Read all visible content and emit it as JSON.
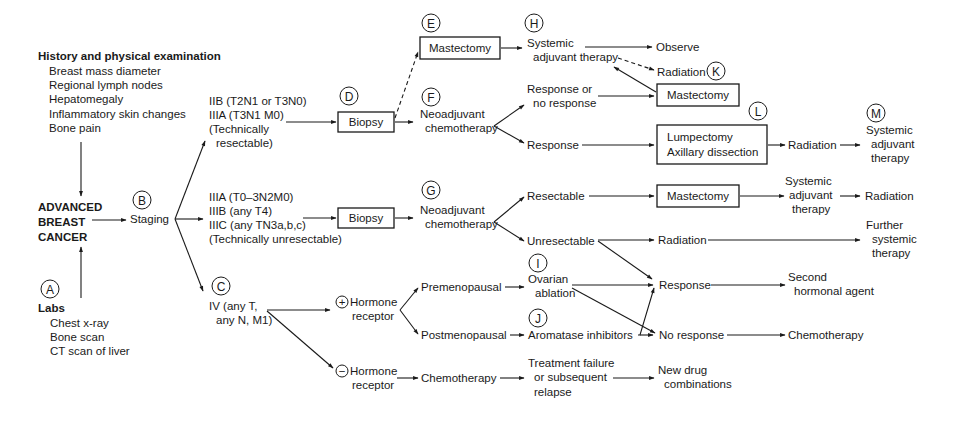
{
  "diagram": {
    "nodes": {
      "history_title": "History and physical examination",
      "history_items": [
        "Breast mass diameter",
        "Regional lymph nodes",
        "Hepatomegaly",
        "Inflammatory skin changes",
        "Bone pain"
      ],
      "abc": [
        "ADVANCED",
        "BREAST",
        "CANCER"
      ],
      "labs_title": "Labs",
      "labs_items": [
        "Chest x-ray",
        "Bone scan",
        "CT scan of liver"
      ],
      "staging": "Staging",
      "stage_resectable": [
        "IIB (T2N1 or T3N0)",
        "IIIA (T3N1 M0)",
        "(Technically",
        "resectable)"
      ],
      "stage_unresectable": [
        "IIIA (T0–3N2M0)",
        "IIIB (any T4)",
        "IIIC (any TN3a,b,c)",
        "(Technically unresectable)"
      ],
      "stage_iv": [
        "IV (any T,",
        "any N, M1)"
      ],
      "biopsy_1": "Biopsy",
      "biopsy_2": "Biopsy",
      "mastectomy_e": "Mastectomy",
      "neoadj_f": [
        "Neoadjuvant",
        "chemotherapy"
      ],
      "neoadj_g": [
        "Neoadjuvant",
        "chemotherapy"
      ],
      "systemic_h": [
        "Systemic",
        "adjuvant therapy"
      ],
      "observe": "Observe",
      "radiation_k": "Radiation",
      "resp_or_no": [
        "Response or",
        "no response"
      ],
      "mastectomy_k": "Mastectomy",
      "response_f": "Response",
      "lumpectomy": [
        "Lumpectomy",
        "Axillary dissection"
      ],
      "radiation_l": "Radiation",
      "systemic_m": [
        "Systemic",
        "adjuvant",
        "therapy"
      ],
      "resectable": "Resectable",
      "mastectomy_g": "Mastectomy",
      "systemic_g": [
        "Systemic",
        "adjuvant",
        "therapy"
      ],
      "radiation_g": "Radiation",
      "unresectable": "Unresectable",
      "radiation_u": "Radiation",
      "further": [
        "Further",
        "systemic",
        "therapy"
      ],
      "hr_pos": [
        "Hormone",
        "receptor"
      ],
      "hr_neg": [
        "Hormone",
        "receptor"
      ],
      "hr_pos_sign": "+",
      "hr_neg_sign": "−",
      "premenopausal": "Premenopausal",
      "postmenopausal": "Postmenopausal",
      "ovarian": [
        "Ovarian",
        "ablation"
      ],
      "aromatase": "Aromatase inhibitors",
      "response_h": "Response",
      "no_response_h": "No response",
      "second_hormonal": [
        "Second",
        "hormonal agent"
      ],
      "chemo_after": "Chemotherapy",
      "chemo_neg": "Chemotherapy",
      "treatment_failure": [
        "Treatment failure",
        "or subsequent",
        "relapse"
      ],
      "new_drug": [
        "New drug",
        "combinations"
      ]
    },
    "step_labels": {
      "A": "A",
      "B": "B",
      "C": "C",
      "D": "D",
      "E": "E",
      "F": "F",
      "G": "G",
      "H": "H",
      "I": "I",
      "J": "J",
      "K": "K",
      "L": "L",
      "M": "M"
    }
  }
}
